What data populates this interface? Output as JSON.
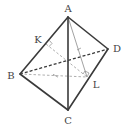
{
  "figure": {
    "type": "tetrahedron",
    "vertices": [
      "A",
      "B",
      "C",
      "D"
    ],
    "points": [
      "K",
      "L"
    ],
    "labels": {
      "A": "A",
      "B": "B",
      "C": "C",
      "D": "D",
      "K": "K",
      "L": "L"
    },
    "visible_edges": [
      [
        "A",
        "B"
      ],
      [
        "A",
        "C"
      ],
      [
        "A",
        "D"
      ],
      [
        "B",
        "C"
      ],
      [
        "C",
        "D"
      ]
    ],
    "hidden_edges": [
      [
        "B",
        "D"
      ]
    ],
    "auxiliary_segments": [
      {
        "from": "A",
        "to": "L",
        "style": "solid-thin"
      },
      {
        "from": "B",
        "to": "L",
        "style": "dashed"
      },
      {
        "from": "K",
        "to": "L",
        "style": "dashed"
      }
    ],
    "right_angle_marks": [
      "K",
      "L"
    ],
    "colors": {
      "edge": "#3a3a3a",
      "auxiliary": "#8a8a8a",
      "label": "#444444"
    }
  }
}
